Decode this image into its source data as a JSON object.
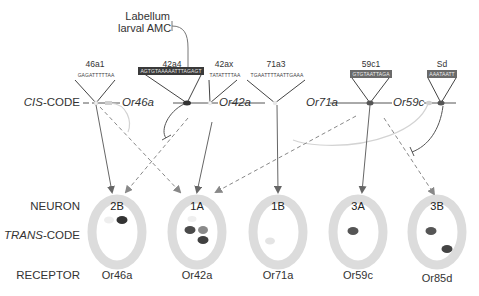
{
  "figure": {
    "row_labels": {
      "cis_code_italic": "CIS",
      "cis_code_rest": "-CODE",
      "neuron": "NEURON",
      "trans_code_italic": "TRANS",
      "trans_code_rest": "-CODE",
      "receptor": "RECEPTOR"
    },
    "external_input": {
      "line1": "Labellum",
      "line2": "larval AMC"
    },
    "cis_elements": [
      {
        "name": "46a1",
        "sequence": "GAGATTTTTAA",
        "style": "plain"
      },
      {
        "name": "42a4",
        "sequence": "AGTGTAAAAATTTAGAGT",
        "style": "dark"
      },
      {
        "name": "42ax",
        "sequence": "TATATTTTAA",
        "style": "plain"
      },
      {
        "name": "71a3",
        "sequence": "TGAATTTTAATTGAAA",
        "style": "plain"
      },
      {
        "name": "59c1",
        "sequence": "GTGTAATTAGA",
        "style": "mid"
      },
      {
        "name": "Sd",
        "sequence": "AAATAATT",
        "style": "mid"
      }
    ],
    "genes": [
      {
        "name": "Or46a"
      },
      {
        "name": "Or42a"
      },
      {
        "name": "Or71a"
      },
      {
        "name": "Or59c"
      }
    ],
    "neurons": [
      {
        "id": "2B",
        "receptor": "Or46a"
      },
      {
        "id": "1A",
        "receptor": "Or42a"
      },
      {
        "id": "1B",
        "receptor": "Or71a"
      },
      {
        "id": "3A",
        "receptor": "Or59c"
      },
      {
        "id": "3B",
        "receptor": "Or85d"
      }
    ],
    "colors": {
      "neuron_ring": "#dcdcdc",
      "line": "#666666",
      "dashed": "#888888",
      "light_line": "#cfcfcf",
      "dark_blob": "#3c3c3c",
      "mid_blob": "#555555",
      "light_blob": "#e6e6e6",
      "pale_blob": "#bdbdbd"
    }
  }
}
